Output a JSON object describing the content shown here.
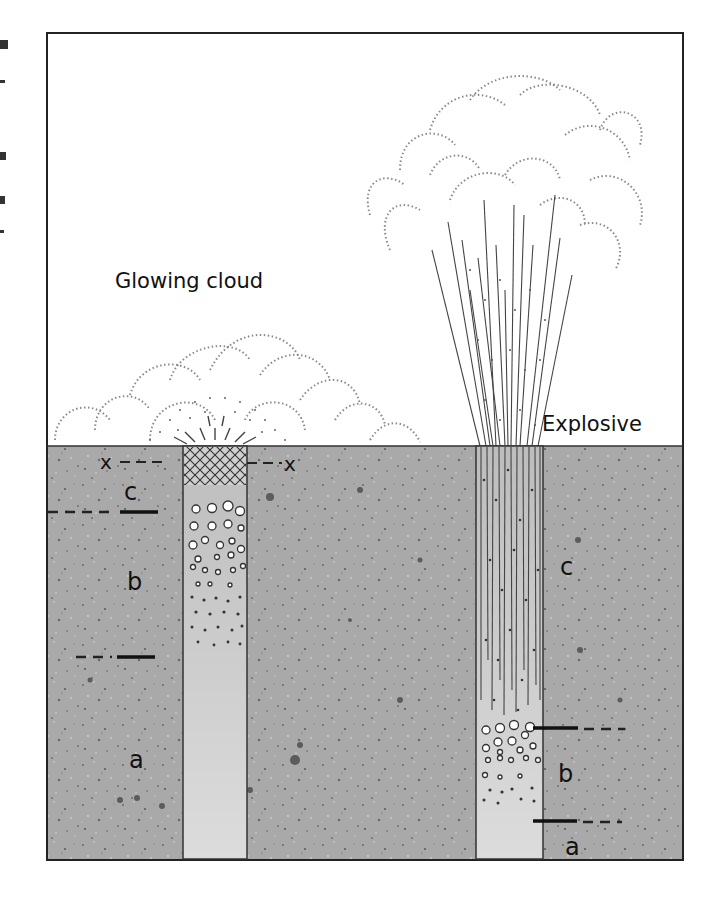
{
  "figure": {
    "frame": {
      "left": 47,
      "top": 33,
      "right": 683,
      "bottom": 860
    },
    "ground_level_y": 446,
    "colors": {
      "ground": "#a9a9a9",
      "ground_light": "#bdbdbd",
      "conduit_fill": "#d6d6d6",
      "line": "#222222",
      "cloud_dots": "#777777"
    },
    "left_panel": {
      "title": "Glowing cloud",
      "conduit": {
        "x1": 183,
        "x2": 247
      },
      "labels": {
        "x_left": "x",
        "x_right": "x",
        "c": "c",
        "b": "b",
        "a": "a"
      }
    },
    "right_panel": {
      "title": "Explosive",
      "conduit": {
        "x1": 476,
        "x2": 543
      },
      "labels": {
        "c": "c",
        "b": "b",
        "a": "a"
      }
    }
  }
}
